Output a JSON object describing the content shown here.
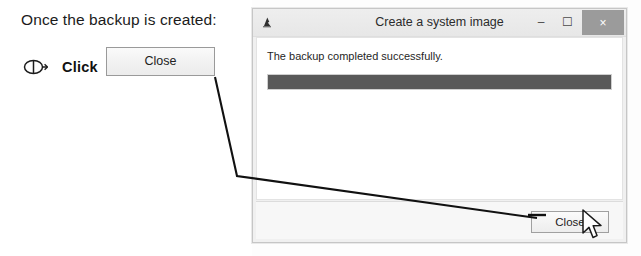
{
  "instruction": {
    "heading": "Once the backup is created:",
    "action_label": "Click",
    "mouse_icon": "mouse-click-icon",
    "ghost_button_label": "Close"
  },
  "dialog": {
    "title": "Create a system image",
    "app_icon": "system-image-icon",
    "titlebar_buttons": [
      {
        "name": "minimize",
        "glyph": "–"
      },
      {
        "name": "maximize",
        "glyph": "☐"
      },
      {
        "name": "close",
        "glyph": "×"
      }
    ],
    "body": {
      "status_text": "The backup completed successfully.",
      "progress_percent": 100
    },
    "footer": {
      "close_label": "Close"
    }
  },
  "annotation": {
    "cursor_icon": "mouse-pointer-arrow",
    "leader_line": "callout-line"
  },
  "colors": {
    "progress_fill": "#595959",
    "titlebar_close_bg": "#9b9b9b",
    "dialog_bg": "#f0f0f0",
    "body_bg": "#ffffff"
  }
}
